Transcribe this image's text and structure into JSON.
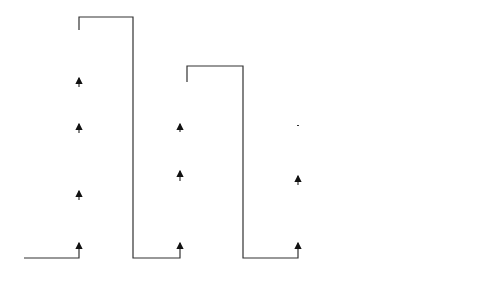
{
  "columns": [
    {
      "name": "source-checks",
      "boxes": [
        {
          "label": "Trustworthiness assessment source",
          "fill": "#b3b3b3"
        },
        {
          "label": "Plausibility check immutable fields",
          "fill": "#b3b3b3"
        },
        {
          "label": "Verify source certificate and signature for immutable fields",
          "fill": "#b3b3b3"
        },
        {
          "label": "Rate limitation check",
          "fill": "#b3b3b3"
        }
      ]
    },
    {
      "name": "sender-checks",
      "boxes": [
        {
          "label": "Trustworthiness assessment sender",
          "fill": "#e4e4e4"
        },
        {
          "label": "Plausibility check mutable fields",
          "fill": "#e4e4e4"
        },
        {
          "label": "Verify sender certificate and signature over mutable fields",
          "fill": "#e4e4e4"
        }
      ]
    },
    {
      "name": "update-and-sign",
      "boxes": [
        {
          "label": "Generate new signature over mutable fields",
          "fill": "#b3b3b3"
        },
        {
          "label": "Update location table and mutable fields",
          "fill": "#b3b3b3"
        }
      ]
    },
    {
      "name": "forwarding",
      "boxes": [
        {
          "label": "Secure forwarding with trustworthiness check",
          "fill": "#ffffff"
        }
      ]
    }
  ],
  "labels": {
    "input": "Receive packet",
    "output": "Send packet"
  }
}
